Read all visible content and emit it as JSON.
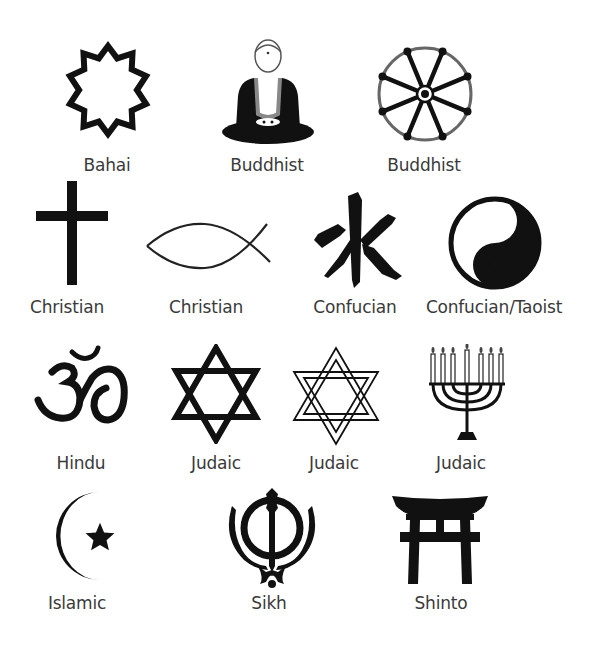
{
  "symbols": [
    {
      "id": "bahai",
      "label": "Bahai",
      "symbol": "nine-pointed-star-icon"
    },
    {
      "id": "buddhist-statue",
      "label": "Buddhist",
      "symbol": "seated-buddha-icon"
    },
    {
      "id": "buddhist-wheel",
      "label": "Buddhist",
      "symbol": "dharma-wheel-icon"
    },
    {
      "id": "christian-cross",
      "label": "Christian",
      "symbol": "latin-cross-icon"
    },
    {
      "id": "christian-fish",
      "label": "Christian",
      "symbol": "ichthys-fish-icon"
    },
    {
      "id": "confucian",
      "label": "Confucian",
      "symbol": "water-character-icon"
    },
    {
      "id": "confucian-taoist",
      "label": "Confucian/Taoist",
      "symbol": "yin-yang-icon"
    },
    {
      "id": "hindu",
      "label": "Hindu",
      "symbol": "om-icon"
    },
    {
      "id": "judaic-star",
      "label": "Judaic",
      "symbol": "star-of-david-icon"
    },
    {
      "id": "judaic-interlaced-star",
      "label": "Judaic",
      "symbol": "interlaced-star-of-david-icon"
    },
    {
      "id": "judaic-menorah",
      "label": "Judaic",
      "symbol": "menorah-icon"
    },
    {
      "id": "islamic",
      "label": "Islamic",
      "symbol": "crescent-star-icon"
    },
    {
      "id": "sikh",
      "label": "Sikh",
      "symbol": "khanda-icon"
    },
    {
      "id": "shinto",
      "label": "Shinto",
      "symbol": "torii-gate-icon"
    }
  ],
  "colors": {
    "background": "#ffffff",
    "symbol": "#111111",
    "label": "#3a3a3a"
  }
}
